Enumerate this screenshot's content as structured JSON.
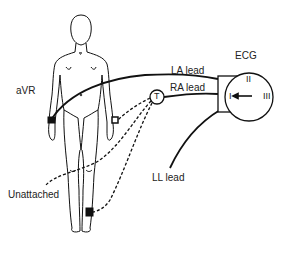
{
  "labels": {
    "avr": "aVR",
    "la_lead": "LA lead",
    "ra_lead": "RA lead",
    "ecg": "ECG",
    "ll_lead": "LL lead",
    "unattached": "Unattached",
    "t_node": "T"
  },
  "ecg_dial": {
    "lead_i": "I",
    "lead_ii": "II",
    "lead_iii": "III",
    "pointer": "I"
  },
  "colors": {
    "stroke": "#111111",
    "text": "#222222",
    "background": "#ffffff"
  }
}
